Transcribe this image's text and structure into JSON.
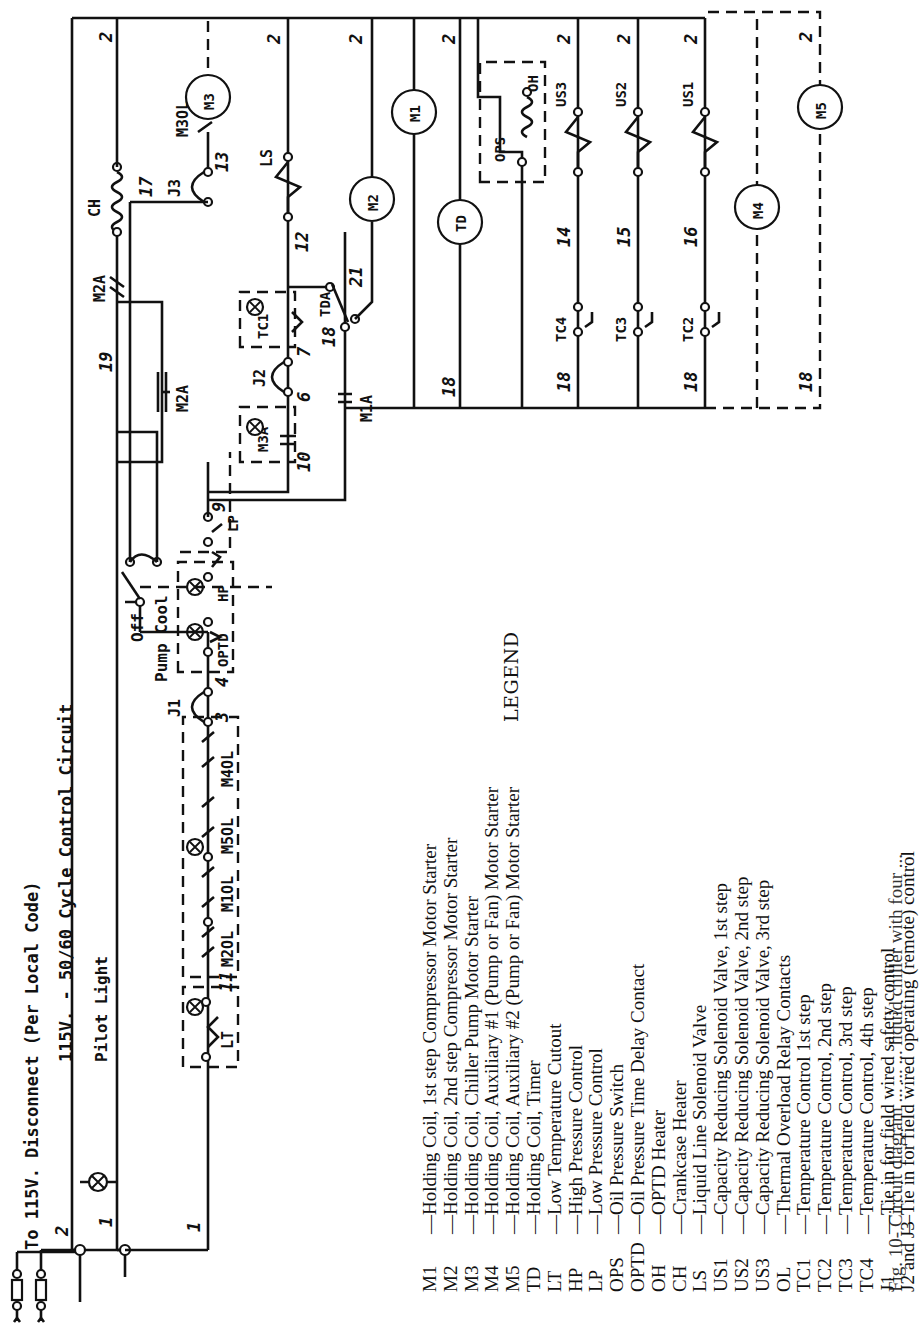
{
  "diagram": {
    "title_line1": "To 115V. Disconnect (Per Local Code)",
    "title_line2": "115V. - 50/60 Cycle Control Circuit",
    "pilot_light_label": "Pilot Light",
    "selector_switch": {
      "label_top": "Off",
      "label_bottom": "Pump Cool"
    },
    "components": {
      "CH": "CH",
      "M3": "M3",
      "M3OL": "M3OL",
      "J3": "J3",
      "LS": "LS",
      "M2": "M2",
      "M1": "M1",
      "TD": "TD",
      "TDA": "TDA",
      "OPS": "OPS",
      "OH": "OH",
      "US3": "US3",
      "US2": "US2",
      "US1": "US1",
      "M4": "M4",
      "M5": "M5",
      "TC4": "TC4",
      "TC3": "TC3",
      "TC2": "TC2",
      "TC1": "TC1",
      "M2A_top": "M2A",
      "M2A": "M2A",
      "M1A": "M1A",
      "J2": "J2",
      "M3A": "M3A",
      "LP": "LP",
      "HP": "HP",
      "OPTD": "OPTD",
      "J1": "J1",
      "M2OL": "M2OL",
      "M1OL": "M1OL",
      "M5OL": "M5OL",
      "M4OL": "M4OL",
      "LT": "LT"
    },
    "wire_numbers": {
      "n1a": "1",
      "n1b": "1",
      "n1c": "1",
      "n2a": "2",
      "n2_ch": "2",
      "n2_ls": "2",
      "n2_m2": "2",
      "n2_td": "2",
      "n2_us3": "2",
      "n2_us2": "2",
      "n2_us1": "2",
      "n2_m5": "2",
      "n19": "19",
      "n17": "17",
      "n13": "13",
      "n12": "12",
      "n21": "21",
      "n18a": "18",
      "n18b": "18",
      "n18c": "18",
      "n18d": "18",
      "n18e": "18",
      "n18f": "18",
      "n18g": "18",
      "n14": "14",
      "n15": "15",
      "n16": "16",
      "n7": "7",
      "n6": "6",
      "n10": "10",
      "n9": "9",
      "n22": "22",
      "n8": "8",
      "n4": "4",
      "n3": "3",
      "n5": "5",
      "n20": "20",
      "n11": "11"
    }
  },
  "legend": {
    "title": "LEGEND",
    "items": [
      {
        "code": "M1",
        "desc": "—Holding Coil, 1st step Compressor Motor Starter"
      },
      {
        "code": "M2",
        "desc": "—Holding Coil, 2nd step Compressor Motor Starter"
      },
      {
        "code": "M3",
        "desc": "—Holding Coil, Chiller Pump Motor Starter"
      },
      {
        "code": "M4",
        "desc": "—Holding Coil, Auxiliary #1 (Pump or Fan) Motor Starter"
      },
      {
        "code": "M5",
        "desc": "—Holding Coil, Auxiliary #2 (Pump or Fan) Motor Starter"
      },
      {
        "code": "TD",
        "desc": "—Holding Coil, Timer"
      },
      {
        "code": "LT",
        "desc": "—Low Temperature Cutout"
      },
      {
        "code": "HP",
        "desc": "—High Pressure Control"
      },
      {
        "code": "LP",
        "desc": "—Low Pressure Control"
      },
      {
        "code": "OPS",
        "desc": "—Oil Pressure Switch"
      },
      {
        "code": "OPTD",
        "desc": "—Oil Pressure Time Delay Contact"
      },
      {
        "code": "OH",
        "desc": "—OPTD Heater"
      },
      {
        "code": "CH",
        "desc": "—Crankcase  Heater"
      },
      {
        "code": "LS",
        "desc": "—Liquid Line Solenoid Valve"
      },
      {
        "code": "US1",
        "desc": "—Capacity Reducing Solenoid Valve, 1st step"
      },
      {
        "code": "US2",
        "desc": "—Capacity Reducing Solenoid Valve, 2nd step"
      },
      {
        "code": "US3",
        "desc": "—Capacity Reducing Solenoid Valve, 3rd step"
      },
      {
        "code": "OL",
        "desc": "—Thermal Overload Relay Contacts"
      },
      {
        "code": "TC1",
        "desc": "—Temperature Control 1st step"
      },
      {
        "code": "TC2",
        "desc": "—Temperature Control, 2nd step"
      },
      {
        "code": "TC3",
        "desc": "—Temperature Control, 3rd step"
      },
      {
        "code": "TC4",
        "desc": "—Temperature Control, 4th step"
      },
      {
        "code": "J1",
        "desc": "—Tie in for field wired safety control"
      },
      {
        "code": "J2 and J3",
        "desc": "—Tie in for field wired operating (remote) control"
      }
    ]
  },
  "caption_partial": "Fig. 10-   Circuit diagram ...   ...   ...   liquid chiller with four ..."
}
